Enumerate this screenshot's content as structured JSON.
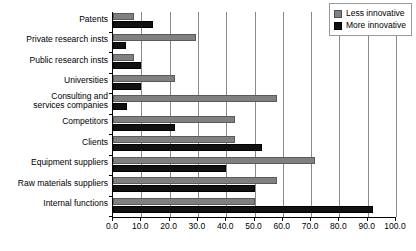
{
  "chart_data": {
    "type": "bar",
    "orientation": "horizontal",
    "title": "",
    "xlabel": "",
    "ylabel": "",
    "xlim": [
      0.0,
      100.0
    ],
    "xticks": [
      "0.0",
      "10.0",
      "20.0",
      "30.0",
      "40.0",
      "50.0",
      "60.0",
      "70.0",
      "80.0",
      "90.0",
      "100.0"
    ],
    "xtick_values": [
      0,
      10,
      20,
      30,
      40,
      50,
      60,
      70,
      80,
      90,
      100
    ],
    "grid": "vertical",
    "legend_position": "top-right",
    "categories": [
      "Patents",
      "Private research insts",
      "Public research insts",
      "Universities",
      "Consulting and\nservices companies",
      "Competitors",
      "Clients",
      "Equipment suppliers",
      "Raw materials suppliers",
      "Internal functions"
    ],
    "series": [
      {
        "name": "Less innovative",
        "color": "#808080",
        "values": [
          7.5,
          29.5,
          7.5,
          22.0,
          58.0,
          43.0,
          43.0,
          71.5,
          58.0,
          50.0
        ]
      },
      {
        "name": "More innovative",
        "color": "#111111",
        "values": [
          14.0,
          4.5,
          10.0,
          10.0,
          5.0,
          22.0,
          52.5,
          40.0,
          50.0,
          92.0
        ]
      }
    ]
  },
  "legend": {
    "items": [
      {
        "label": "Less innovative",
        "swatch": "gray-swatch"
      },
      {
        "label": "More innovative",
        "swatch": "black-swatch"
      }
    ]
  }
}
